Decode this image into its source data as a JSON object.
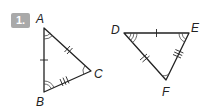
{
  "problem": {
    "number_label": "1.",
    "badge_color": "#a9a9a9"
  },
  "triangles": [
    {
      "name": "triangle-abc",
      "vertices": [
        {
          "label": "A",
          "x": 44,
          "y": 28,
          "angle_arcs": 2
        },
        {
          "label": "B",
          "x": 44,
          "y": 92,
          "angle_arcs": 2
        },
        {
          "label": "C",
          "x": 91,
          "y": 71,
          "angle_arcs": 1
        }
      ],
      "sides": [
        {
          "from": "A",
          "to": "B",
          "tick_marks": 1
        },
        {
          "from": "A",
          "to": "C",
          "tick_marks": 2
        },
        {
          "from": "B",
          "to": "C",
          "tick_marks": 3
        }
      ]
    },
    {
      "name": "triangle-def",
      "vertices": [
        {
          "label": "D",
          "x": 124,
          "y": 33,
          "angle_arcs": 3
        },
        {
          "label": "E",
          "x": 189,
          "y": 33,
          "angle_arcs": 2
        },
        {
          "label": "F",
          "x": 166,
          "y": 80,
          "angle_arcs": 1
        }
      ],
      "sides": [
        {
          "from": "D",
          "to": "E",
          "tick_marks": 1
        },
        {
          "from": "D",
          "to": "F",
          "tick_marks": 2
        },
        {
          "from": "E",
          "to": "F",
          "tick_marks": 3
        }
      ]
    }
  ],
  "labels": {
    "A": "A",
    "B": "B",
    "C": "C",
    "D": "D",
    "E": "E",
    "F": "F"
  }
}
